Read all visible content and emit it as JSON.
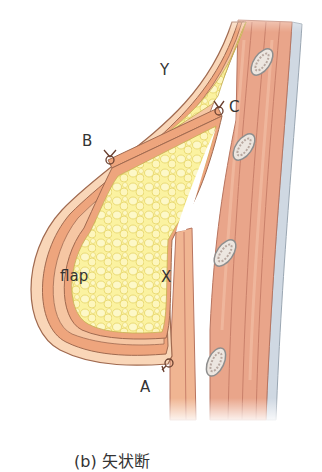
{
  "figure": {
    "caption": "(b) 矢状断",
    "labels": {
      "y": "Y",
      "b": "B",
      "c": "C",
      "x": "X",
      "a": "A",
      "flap": "flap"
    },
    "colors": {
      "skin": "#f7cfae",
      "dermis": "#eea57d",
      "fat": "#fbf2a0",
      "fat_outline": "#e8d860",
      "muscle": "#e9a58a",
      "muscle_dark": "#d98a72",
      "rib": "#e8e2dc",
      "pleura": "#cfd8e0",
      "outline": "#a06a50",
      "background": "#ffffff"
    }
  }
}
